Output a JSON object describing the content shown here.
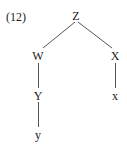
{
  "example_number": "(12)",
  "tree": {
    "root": {
      "label": "Z"
    },
    "left": {
      "label": "W",
      "child": {
        "label": "Y",
        "child": {
          "label": "y"
        }
      }
    },
    "right": {
      "label": "X",
      "child": {
        "label": "x"
      }
    }
  },
  "colors": {
    "text": "#222222",
    "edges": "#555555",
    "background": "#ffffff"
  }
}
